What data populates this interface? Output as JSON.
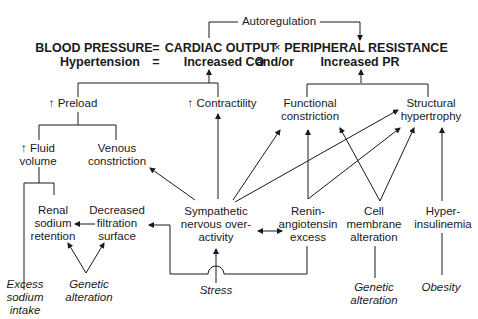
{
  "header": {
    "autoregulation": "Autoregulation",
    "equation_line1": {
      "blood_pressure": "BLOOD PRESSURE",
      "eq1": "=",
      "cardiac_output": "CARDIAC OUTPUT",
      "times": "×",
      "peripheral_resistance": "PERIPHERAL RESISTANCE"
    },
    "equation_line2": {
      "hypertension": "Hypertension",
      "eq2": "=",
      "increased_co": "Increased CO",
      "andor": "and/or",
      "increased_pr": "Increased PR"
    }
  },
  "nodes": {
    "preload": "↑ Preload",
    "contractility": "↑ Contractility",
    "functional_constriction": "Functional\nconstriction",
    "structural_hypertrophy": "Structural\nhypertrophy",
    "fluid_volume": "↑ Fluid\nvolume",
    "venous_constriction": "Venous\nconstriction",
    "renal_sodium_retention": "Renal\nsodium\nretention",
    "decreased_filtration_surface": "Decreased\nfiltration\nsurface",
    "sympathetic": "Sympathetic\nnervous over-\nactivity",
    "renin_angiotensin": "Renin-\nangiotensin\nexcess",
    "cell_membrane": "Cell\nmembrane\nalteration",
    "hyperinsulinemia": "Hyper-\ninsulinemia"
  },
  "causes": {
    "excess_sodium": "Excess\nsodium\nintake",
    "genetic_alteration_left": "Genetic\nalteration",
    "stress": "Stress",
    "genetic_alteration_right": "Genetic\nalteration",
    "obesity": "Obesity"
  },
  "colors": {
    "ink": "#1a1a1a",
    "background": "#ffffff"
  }
}
